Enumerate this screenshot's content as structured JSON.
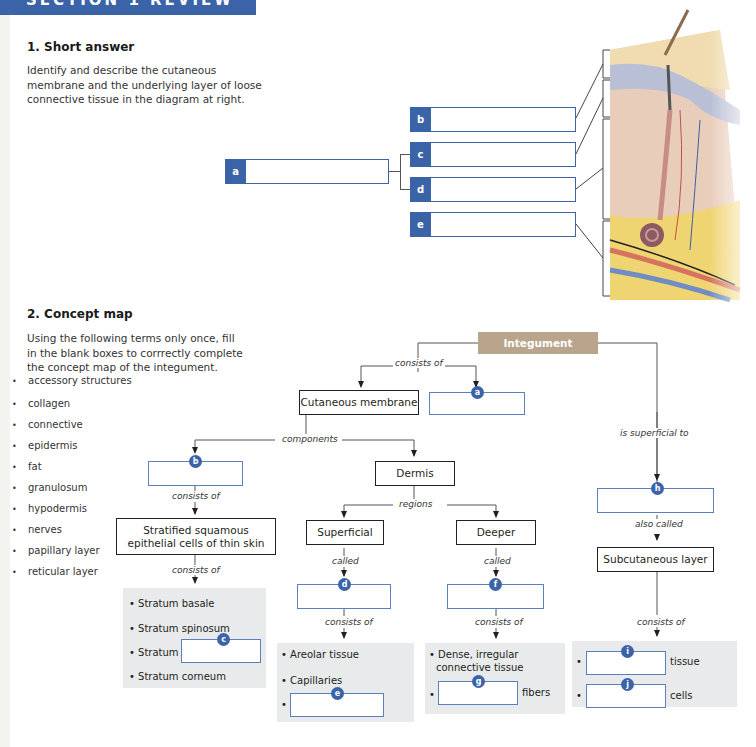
{
  "header": {
    "banner_text": "SECTION 1 REVIEW"
  },
  "section1": {
    "title": "1. Short answer",
    "instructions": "Identify and describe the cutaneous membrane and the underlying layer of loose connective tissue in the diagram at right.",
    "instruction_lines": [
      "Identify and describe the cutaneous",
      "membrane and the underlying layer of loose",
      "connective tissue in the diagram at right."
    ],
    "labels": [
      {
        "tag": "a",
        "value": ""
      },
      {
        "tag": "b",
        "value": ""
      },
      {
        "tag": "c",
        "value": ""
      },
      {
        "tag": "d",
        "value": ""
      },
      {
        "tag": "e",
        "value": ""
      }
    ],
    "figure": "skin-cross-section-illustration"
  },
  "section2": {
    "title": "2. Concept map",
    "instruction_lines": [
      "Using the following terms only once, fill",
      "in the blank boxes to corrrectly complete",
      "the concept map of the integument."
    ],
    "terms": [
      "accessory structures",
      "collagen",
      "connective",
      "epidermis",
      "fat",
      "granulosum",
      "hypodermis",
      "nerves",
      "papillary layer",
      "reticular layer"
    ],
    "map": {
      "root": "Integument",
      "nodes": {
        "cutaneous": "Cutaneous membrane",
        "dermis": "Dermis",
        "stratified": [
          "Stratified squamous",
          "epithelial cells of thin skin"
        ],
        "superficial": "Superficial",
        "deeper": "Deeper",
        "subcutaneous": "Subcutaneous layer"
      },
      "links": {
        "consists_of": "consists of",
        "components": "components",
        "regions": "regions",
        "called": "called",
        "is_superficial_to": "is superficial to",
        "also_called": "also called"
      },
      "blanks": {
        "a": {
          "tag": "a",
          "value": ""
        },
        "b": {
          "tag": "b",
          "value": ""
        },
        "c": {
          "tag": "c",
          "value": ""
        },
        "d": {
          "tag": "d",
          "value": ""
        },
        "e": {
          "tag": "e",
          "value": ""
        },
        "f": {
          "tag": "f",
          "value": ""
        },
        "g": {
          "tag": "g",
          "value": ""
        },
        "h": {
          "tag": "h",
          "value": ""
        },
        "i": {
          "tag": "i",
          "value": ""
        },
        "j": {
          "tag": "j",
          "value": ""
        }
      },
      "panels": {
        "strata": [
          "• Stratum basale",
          "• Stratum spinosum",
          "• Stratum",
          "• Stratum corneum"
        ],
        "papillary": [
          "• Areolar tissue",
          "• Capillaries",
          "•"
        ],
        "reticular": [
          "• Dense, irregular",
          "connective tissue",
          "•",
          "fibers"
        ],
        "hypodermis": [
          "•",
          "tissue",
          "•",
          "cells"
        ]
      }
    }
  },
  "colors": {
    "accent_blue": "#3b63a8",
    "integument_tan": "#b9a58c",
    "panel_gray": "#e8eaeb"
  }
}
